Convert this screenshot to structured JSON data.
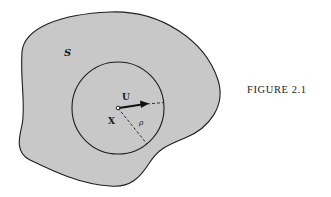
{
  "figure": {
    "caption": "FIGURE 2.1",
    "region_label": "S",
    "point_label": "X",
    "vector_label": "U",
    "radius_label": "ρ"
  },
  "colors": {
    "background": "#ffffff",
    "region_fill": "#c8c8c8",
    "stroke": "#1e1e1e"
  },
  "geometry": {
    "circle_center": [
      118,
      108
    ],
    "circle_radius": 46
  }
}
